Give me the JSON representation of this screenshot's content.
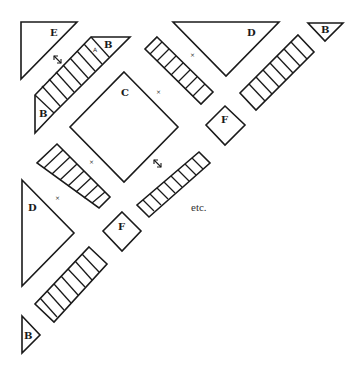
{
  "diagram": {
    "labels": {
      "E": "E",
      "C": "C",
      "D_top": "D",
      "D_left": "D",
      "B_stair_top": "B",
      "B_stair_bottom": "B",
      "B_top_right": "B",
      "B_bottom_left": "B",
      "F_upper": "F",
      "F_lower": "F",
      "A": "A",
      "etc": "etc."
    },
    "markers": {
      "x": "×"
    },
    "colors": {
      "stroke": "#1a1a1a",
      "background": "#ffffff"
    }
  }
}
